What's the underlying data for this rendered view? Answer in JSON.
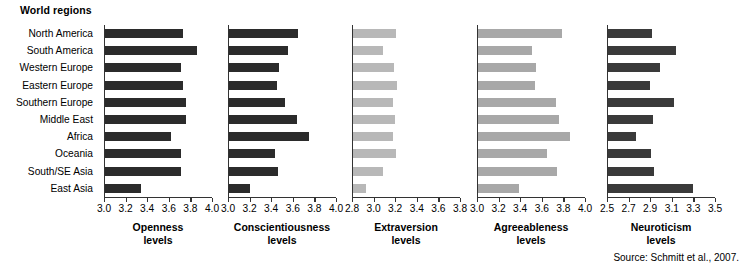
{
  "header": {
    "title": "World regions"
  },
  "source": "Source: Schmitt et al., 2007.",
  "chart_data": {
    "type": "bar",
    "title": "World regions",
    "orientation": "horizontal",
    "grid": false,
    "legend": "none",
    "categories": [
      "North America",
      "South America",
      "Western Europe",
      "Eastern Europe",
      "Southern Europe",
      "Middle East",
      "Africa",
      "Oceania",
      "South/SE Asia",
      "East Asia"
    ],
    "panels": [
      {
        "name": "openness",
        "title_line1": "Openness",
        "title_line2": "levels",
        "xlabel": "Openness levels",
        "ylabel": "World regions",
        "xlim": [
          3.0,
          4.0
        ],
        "ticks": [
          "3.0",
          "3.2",
          "3.4",
          "3.6",
          "3.8",
          "4.0"
        ],
        "tick_values": [
          3.0,
          3.2,
          3.4,
          3.6,
          3.8,
          4.0
        ],
        "bar_color": "#2b2b2b",
        "values": [
          3.72,
          3.85,
          3.7,
          3.72,
          3.75,
          3.75,
          3.61,
          3.7,
          3.7,
          3.33
        ]
      },
      {
        "name": "conscientiousness",
        "title_line1": "Conscientiousness",
        "title_line2": "levels",
        "xlabel": "Conscientiousness levels",
        "ylabel": "World regions",
        "xlim": [
          3.0,
          4.0
        ],
        "ticks": [
          "3.0",
          "3.2",
          "3.4",
          "3.6",
          "3.8",
          "4.0"
        ],
        "tick_values": [
          3.0,
          3.2,
          3.4,
          3.6,
          3.8,
          4.0
        ],
        "bar_color": "#2b2b2b",
        "values": [
          3.64,
          3.55,
          3.46,
          3.44,
          3.52,
          3.63,
          3.74,
          3.43,
          3.45,
          3.19
        ]
      },
      {
        "name": "extraversion",
        "title_line1": "Extraversion",
        "title_line2": "levels",
        "xlabel": "Extraversion levels",
        "ylabel": "World regions",
        "xlim": [
          2.8,
          3.8
        ],
        "ticks": [
          "2.8",
          "3.0",
          "3.2",
          "3.4",
          "3.6",
          "3.8"
        ],
        "tick_values": [
          2.8,
          3.0,
          3.2,
          3.4,
          3.6,
          3.8
        ],
        "bar_color": "#b8b8b8",
        "values": [
          3.2,
          3.08,
          3.18,
          3.21,
          3.17,
          3.19,
          3.17,
          3.2,
          3.08,
          2.92
        ]
      },
      {
        "name": "agreeableness",
        "title_line1": "Agreeableness",
        "title_line2": "levels",
        "xlabel": "Agreeableness levels",
        "ylabel": "World regions",
        "xlim": [
          3.0,
          4.0
        ],
        "ticks": [
          "3.0",
          "3.2",
          "3.4",
          "3.6",
          "3.8",
          "4.0"
        ],
        "tick_values": [
          3.0,
          3.2,
          3.4,
          3.6,
          3.8,
          4.0
        ],
        "bar_color": "#a8a8a8",
        "values": [
          3.78,
          3.5,
          3.54,
          3.53,
          3.72,
          3.75,
          3.85,
          3.64,
          3.73,
          3.38
        ]
      },
      {
        "name": "neuroticism",
        "title_line1": "Neuroticism",
        "title_line2": "levels",
        "xlabel": "Neuroticism levels",
        "ylabel": "World regions",
        "xlim": [
          2.5,
          3.5
        ],
        "ticks": [
          "2.5",
          "2.7",
          "2.9",
          "3.1",
          "3.3",
          "3.5"
        ],
        "tick_values": [
          2.5,
          2.7,
          2.9,
          3.1,
          3.3,
          3.5
        ],
        "bar_color": "#3a3a3a",
        "values": [
          2.91,
          3.13,
          2.98,
          2.89,
          3.11,
          2.92,
          2.76,
          2.9,
          2.93,
          3.29
        ]
      }
    ]
  },
  "layout": {
    "panel_lefts": [
      104,
      228,
      352,
      477,
      607
    ],
    "panel_widths": [
      108,
      108,
      108,
      108,
      108
    ],
    "plot_top": 25,
    "plot_height": 172,
    "row_height": 17.2
  }
}
